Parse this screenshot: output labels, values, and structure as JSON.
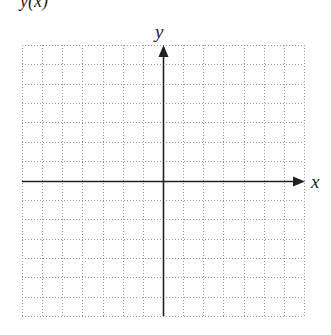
{
  "figure": {
    "header_label": "y(x)",
    "axis_labels": {
      "x": "x",
      "y": "y"
    },
    "grid": {
      "left": 22,
      "right": 304,
      "top": 45,
      "bottom": 316,
      "columns": 14,
      "rows": 14,
      "line_style": "dotted",
      "line_color": "#9a9a9a"
    },
    "axes": {
      "origin_x": 163,
      "origin_y": 181,
      "x_arrow_tip": 304,
      "y_arrow_tip": 46,
      "color": "#222222"
    }
  }
}
